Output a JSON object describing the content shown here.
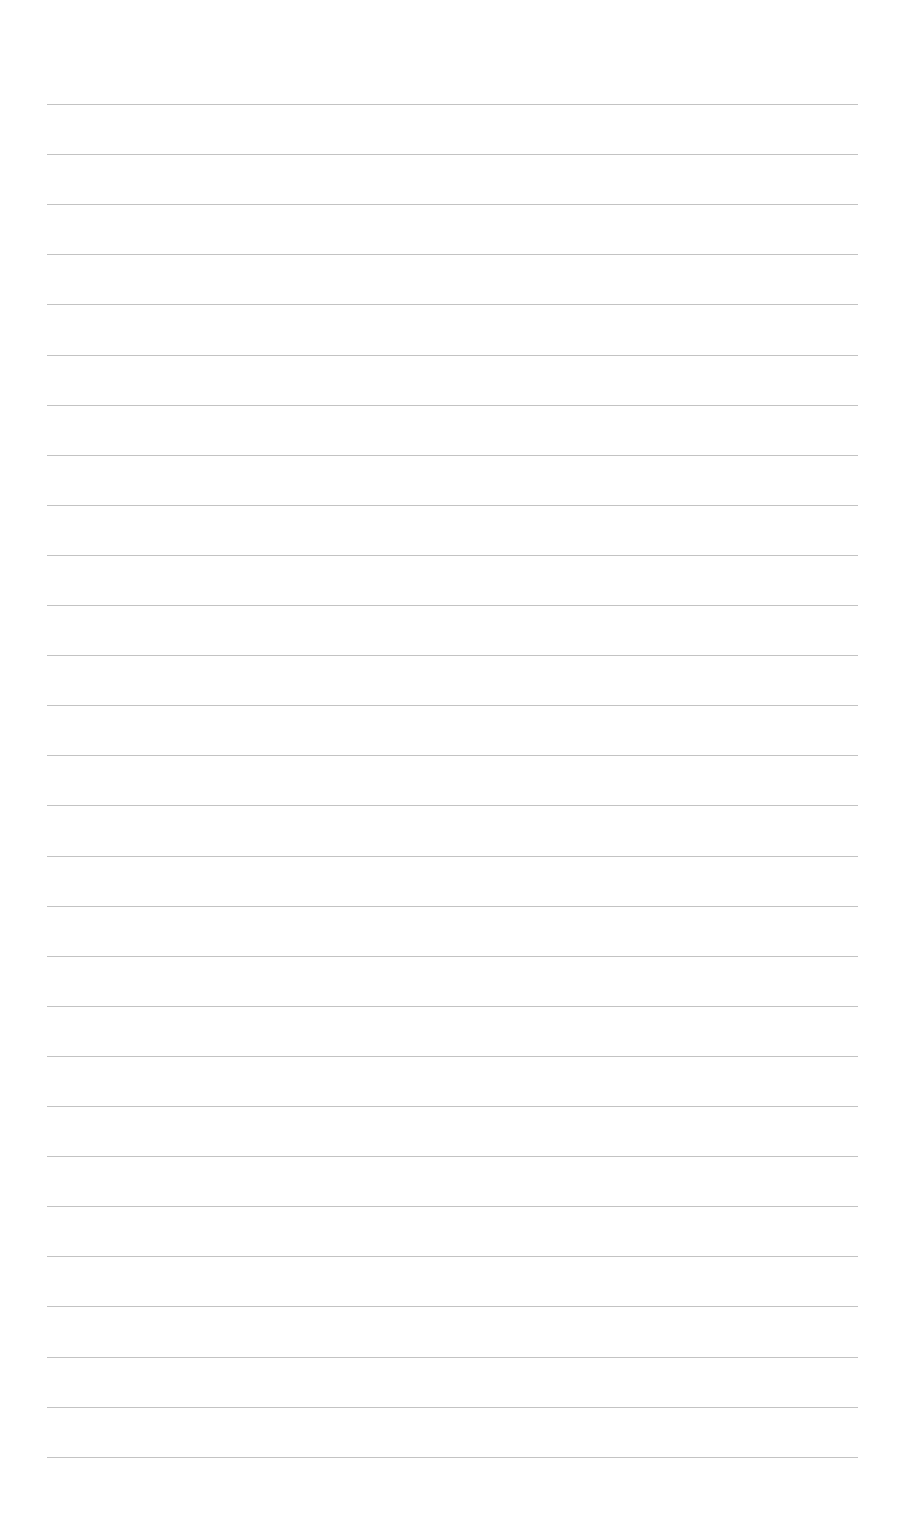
{
  "page": {
    "type": "blank-ruled-sheet",
    "line_count": 28,
    "first_line_y": 104,
    "line_spacing": 50.1,
    "line_left": 47,
    "line_right": 858,
    "line_color": "#b8b8b8",
    "background": "#ffffff"
  }
}
